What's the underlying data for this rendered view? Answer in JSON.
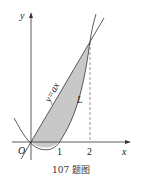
{
  "figure": {
    "caption": "107 题图",
    "axes": {
      "x_label": "x",
      "y_label": "y",
      "origin_label": "O"
    },
    "ticks": [
      "1",
      "2"
    ],
    "curves": {
      "line_label": "y=ax",
      "curve_label": "L"
    },
    "colors": {
      "fill": "#c8c8c8",
      "stroke": "#333333"
    }
  }
}
